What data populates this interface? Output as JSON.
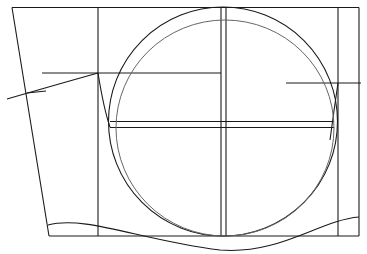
{
  "diagram": {
    "type": "technical-line-drawing",
    "width": 367,
    "height": 254,
    "stroke_color": "#1a1a1a",
    "inner_stroke_color": "#666666",
    "text": []
  }
}
